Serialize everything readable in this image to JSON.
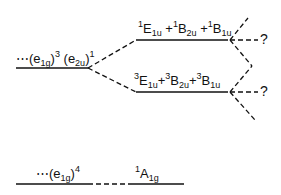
{
  "diagram": {
    "type": "energy-level-diagram",
    "configurations": {
      "excited": {
        "prefix": "⋯(e",
        "sub1": "1g",
        "sup1": "3",
        "mid": " (e",
        "sub2": "2u",
        "sup2": "1",
        "close": ")"
      },
      "ground": {
        "prefix": "⋯(e",
        "sub1": "1g",
        "sup1": "4",
        "close": ")"
      }
    },
    "states": {
      "singlet": {
        "m1": "1",
        "t1": "E",
        "s1": "1u",
        "m2": "1",
        "t2": "B",
        "s2": "2u",
        "m3": "1",
        "t3": "B",
        "s3": "1u",
        "plus": "+"
      },
      "triplet": {
        "m1": "3",
        "t1": "E",
        "s1": "1u",
        "m2": "3",
        "t2": "B",
        "s2": "2u",
        "m3": "3",
        "t3": "B",
        "s3": "1u",
        "plus": "+"
      },
      "ground": {
        "m": "1",
        "t": "A",
        "s": "1g"
      }
    },
    "unknown_marker": "?",
    "colors": {
      "line": "#111111",
      "background": "#ffffff"
    }
  }
}
